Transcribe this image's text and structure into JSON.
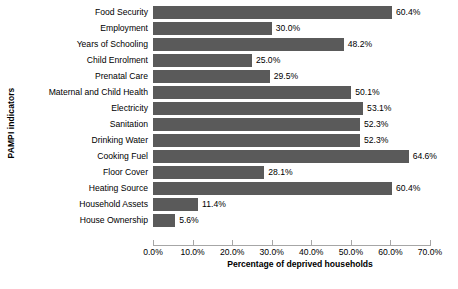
{
  "chart_data": {
    "type": "bar",
    "orientation": "horizontal",
    "title": "",
    "xlabel": "Percentage of deprived households",
    "ylabel": "PAMPI indicators",
    "xlim": [
      0,
      70
    ],
    "grid": false,
    "legend": null,
    "bar_color": "#5a5a5a",
    "axis_color": "#a6a6a6",
    "value_label_suffix": "%",
    "categories": [
      "Food Security",
      "Employment",
      "Years of Schooling",
      "Child Enrolment",
      "Prenatal Care",
      "Maternal and Child Health",
      "Electricity",
      "Sanitation",
      "Drinking Water",
      "Cooking Fuel",
      "Floor Cover",
      "Heating Source",
      "Household Assets",
      "House Ownership"
    ],
    "values": [
      60.4,
      30.0,
      48.2,
      25.0,
      29.5,
      50.1,
      53.1,
      52.3,
      52.3,
      64.6,
      28.1,
      60.4,
      11.4,
      5.6
    ],
    "value_labels": [
      "60.4%",
      "30.0%",
      "48.2%",
      "25.0%",
      "29.5%",
      "50.1%",
      "53.1%",
      "52.3%",
      "52.3%",
      "64.6%",
      "28.1%",
      "60.4%",
      "11.4%",
      "5.6%"
    ],
    "xticks": [
      0,
      10,
      20,
      30,
      40,
      50,
      60,
      70
    ],
    "xtick_labels": [
      "0.0%",
      "10.0%",
      "20.0%",
      "30.0%",
      "40.0%",
      "50.0%",
      "60.0%",
      "70.0%"
    ]
  }
}
